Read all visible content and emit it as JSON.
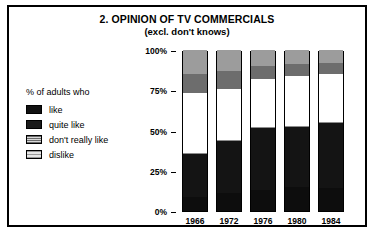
{
  "chart_data": {
    "type": "bar",
    "subtype": "stacked-percentage-column",
    "title": "2. OPINION OF TV COMMERCIALS",
    "subtitle": "(excl. don't knows)",
    "legend_title": "% of adults who",
    "legend_position": "left",
    "xlabel": "",
    "ylabel": "",
    "ylim": [
      0,
      100
    ],
    "ytick_labels": [
      "0%",
      "25%",
      "50%",
      "75%",
      "100%"
    ],
    "ytick_values": [
      0,
      25,
      50,
      75,
      100
    ],
    "grid": false,
    "categories": [
      "1966",
      "1972",
      "1976",
      "1980",
      "1984"
    ],
    "series": [
      {
        "name": "like",
        "values": [
          9,
          11,
          13,
          15,
          14
        ]
      },
      {
        "name": "quite like",
        "values": [
          27,
          33,
          39,
          38,
          41
        ]
      },
      {
        "name": "don't really like",
        "values": [
          37,
          32,
          30,
          31,
          30
        ]
      },
      {
        "name": "dislike",
        "values": [
          27,
          24,
          18,
          16,
          15
        ]
      }
    ],
    "colors": {
      "like": "#0d0d0d",
      "quite_like": "#141414",
      "dont_really_like": "#ffffff",
      "dislike": "#8a8a8a",
      "frame": "#000000",
      "background": "#ffffff"
    }
  },
  "chart": {
    "title": "2. OPINION OF TV COMMERCIALS",
    "subtitle": "(excl. don't knows)"
  },
  "legend": {
    "title": "% of adults who",
    "items": [
      {
        "label": "like",
        "swatch": "like-swatch"
      },
      {
        "label": "quite like",
        "swatch": "quite-like-swatch"
      },
      {
        "label": "don't really like",
        "swatch": "dont-really-like-swatch"
      },
      {
        "label": "dislike",
        "swatch": "dislike-swatch"
      }
    ]
  },
  "yaxis": {
    "ticks": [
      {
        "label": "100%",
        "value": 100
      },
      {
        "label": "75%",
        "value": 75
      },
      {
        "label": "50%",
        "value": 50
      },
      {
        "label": "25%",
        "value": 25
      },
      {
        "label": "0%",
        "value": 0
      }
    ]
  },
  "xaxis": {
    "ticks": [
      "1966",
      "1972",
      "1976",
      "1980",
      "1984"
    ]
  }
}
